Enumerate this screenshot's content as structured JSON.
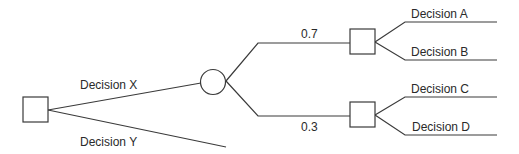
{
  "diagram": {
    "type": "decision-tree",
    "nodes": [
      {
        "id": "root",
        "kind": "decision"
      },
      {
        "id": "chance1",
        "kind": "chance"
      },
      {
        "id": "d_upper",
        "kind": "decision"
      },
      {
        "id": "d_lower",
        "kind": "decision"
      }
    ],
    "edges": [
      {
        "id": "decision-x",
        "from": "root",
        "to": "chance1",
        "label": "Decision X"
      },
      {
        "id": "decision-y",
        "from": "root",
        "to": null,
        "label": "Decision Y"
      },
      {
        "id": "prob-upper",
        "from": "chance1",
        "to": "d_upper",
        "label": "0.7"
      },
      {
        "id": "prob-lower",
        "from": "chance1",
        "to": "d_lower",
        "label": "0.3"
      },
      {
        "id": "decision-a",
        "from": "d_upper",
        "to": null,
        "label": "Decision A"
      },
      {
        "id": "decision-b",
        "from": "d_upper",
        "to": null,
        "label": "Decision B"
      },
      {
        "id": "decision-c",
        "from": "d_lower",
        "to": null,
        "label": "Decision C"
      },
      {
        "id": "decision-d",
        "from": "d_lower",
        "to": null,
        "label": "Decision D"
      }
    ],
    "labels": {
      "decision_x": "Decision X",
      "decision_y": "Decision Y",
      "prob_upper": "0.7",
      "prob_lower": "0.3",
      "decision_a": "Decision A",
      "decision_b": "Decision B",
      "decision_c": "Decision C",
      "decision_d": "Decision D"
    },
    "colors": {
      "line": "#3a3a3a",
      "text": "#2a2a2a",
      "background": "#ffffff"
    }
  }
}
